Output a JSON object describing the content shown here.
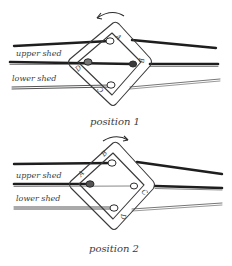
{
  "colors": {
    "ink": "#2b2b2b",
    "light_ink": "#7a7a7a",
    "background": "#ffffff"
  },
  "labels": {
    "upper_shed": "upper shed",
    "lower_shed": "lower shed"
  },
  "panels": [
    {
      "caption": "position 1",
      "rotation": "counterclockwise",
      "holes": {
        "top": "A",
        "right": "B",
        "bottom": "C",
        "left": "D"
      }
    },
    {
      "caption": "position 2",
      "rotation": "clockwise",
      "holes": {
        "top": "B",
        "right": "C",
        "bottom": "D",
        "left": "A"
      }
    }
  ]
}
